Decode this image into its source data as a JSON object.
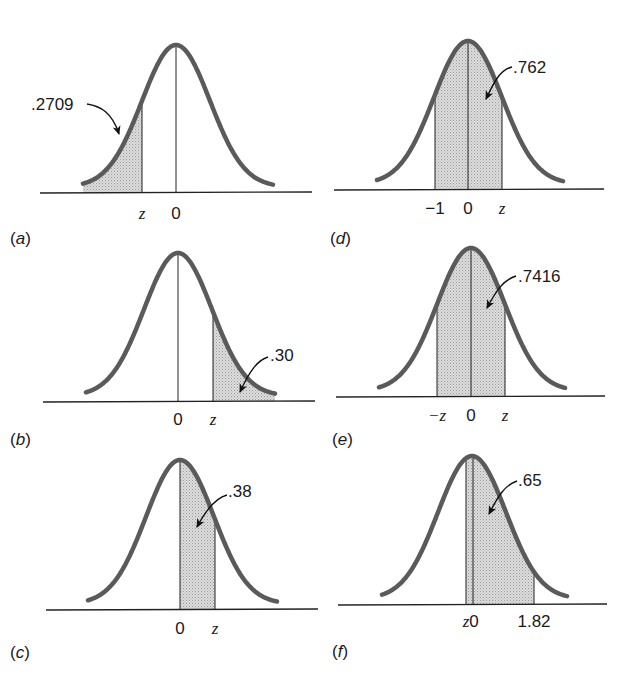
{
  "figure": {
    "panels": [
      {
        "id": "a",
        "label_open": "(",
        "label_letter": "a",
        "label_close": ")",
        "area": ".2709",
        "ticks": [
          "z",
          "0"
        ],
        "shaded": "left tail below z"
      },
      {
        "id": "b",
        "label_open": "(",
        "label_letter": "b",
        "label_close": ")",
        "area": ".30",
        "ticks": [
          "0",
          "z"
        ],
        "shaded": "right tail above z"
      },
      {
        "id": "c",
        "label_open": "(",
        "label_letter": "c",
        "label_close": ")",
        "area": ".38",
        "ticks": [
          "0",
          "z"
        ],
        "shaded": "between 0 and z"
      },
      {
        "id": "d",
        "label_open": "(",
        "label_letter": "d",
        "label_close": ")",
        "area": ".762",
        "ticks": [
          "−1",
          "0",
          "z"
        ],
        "shaded": "between -1 and z"
      },
      {
        "id": "e",
        "label_open": "(",
        "label_letter": "e",
        "label_close": ")",
        "area": ".7416",
        "ticks": [
          "−z",
          "0",
          "z"
        ],
        "shaded": "between -z and z"
      },
      {
        "id": "f",
        "label_open": "(",
        "label_letter": "f",
        "label_close": ")",
        "area": ".65",
        "ticks": [
          "z",
          "0",
          "1.82"
        ],
        "shaded": "between z and 1.82"
      }
    ]
  },
  "colors": {
    "curve": "#5a5a5a",
    "shade": "#d4d4d4",
    "axis": "#222222"
  }
}
